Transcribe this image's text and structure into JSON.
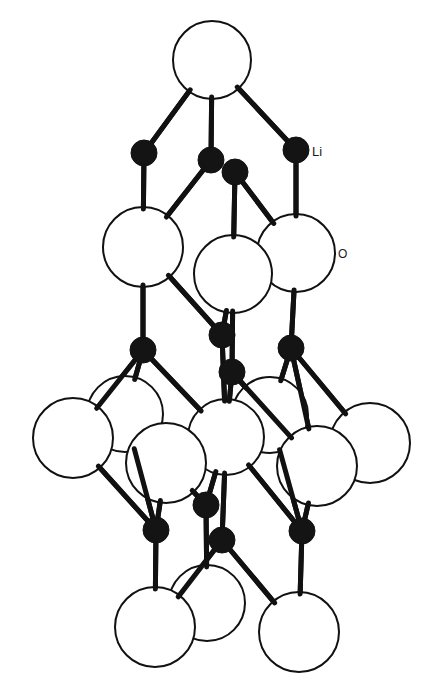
{
  "diagram": {
    "type": "crystal-structure",
    "background_color": "#ffffff",
    "stroke_color": "#111111",
    "labels": {
      "li": {
        "text": "Li",
        "x": 312,
        "y": 156
      },
      "o": {
        "text": "O",
        "x": 338,
        "y": 258
      }
    },
    "legend_colors": {
      "Li": "#141414",
      "O": "#ffffff"
    },
    "oxygen_atoms": [
      {
        "id": "o1",
        "x": 212,
        "y": 60,
        "r": 39
      },
      {
        "id": "o2",
        "x": 143,
        "y": 247,
        "r": 40
      },
      {
        "id": "o4",
        "x": 296,
        "y": 253,
        "r": 39
      },
      {
        "id": "o3",
        "x": 233,
        "y": 274,
        "r": 39
      },
      {
        "id": "o5",
        "x": 125,
        "y": 414,
        "r": 38
      },
      {
        "id": "o6",
        "x": 270,
        "y": 415,
        "r": 38
      },
      {
        "id": "o7",
        "x": 73,
        "y": 438,
        "r": 40
      },
      {
        "id": "o9",
        "x": 226,
        "y": 437,
        "r": 38
      },
      {
        "id": "o11",
        "x": 370,
        "y": 443,
        "r": 40
      },
      {
        "id": "o8",
        "x": 166,
        "y": 463,
        "r": 40
      },
      {
        "id": "o10",
        "x": 317,
        "y": 466,
        "r": 40
      },
      {
        "id": "o12",
        "x": 207,
        "y": 603,
        "r": 38
      },
      {
        "id": "o13",
        "x": 155,
        "y": 627,
        "r": 40
      },
      {
        "id": "o14",
        "x": 299,
        "y": 632,
        "r": 40
      }
    ],
    "lithium_atoms": [
      {
        "id": "li1",
        "x": 144,
        "y": 153,
        "r": 13
      },
      {
        "id": "li2",
        "x": 211,
        "y": 160,
        "r": 13
      },
      {
        "id": "li3",
        "x": 235,
        "y": 172,
        "r": 13
      },
      {
        "id": "li4",
        "x": 296,
        "y": 150,
        "r": 13
      },
      {
        "id": "li5",
        "x": 143,
        "y": 350,
        "r": 13
      },
      {
        "id": "li6",
        "x": 222,
        "y": 335,
        "r": 13
      },
      {
        "id": "li7",
        "x": 232,
        "y": 372,
        "r": 13
      },
      {
        "id": "li8",
        "x": 291,
        "y": 348,
        "r": 13
      },
      {
        "id": "li9",
        "x": 156,
        "y": 530,
        "r": 13
      },
      {
        "id": "li10",
        "x": 206,
        "y": 505,
        "r": 13
      },
      {
        "id": "li11",
        "x": 222,
        "y": 540,
        "r": 13
      },
      {
        "id": "li12",
        "x": 302,
        "y": 531,
        "r": 13
      }
    ],
    "bonds": [
      [
        "o1",
        "li1"
      ],
      [
        "o1",
        "li2"
      ],
      [
        "o1",
        "li4"
      ],
      [
        "li1",
        "o2"
      ],
      [
        "li2",
        "o2"
      ],
      [
        "li3",
        "o3"
      ],
      [
        "li3",
        "o4"
      ],
      [
        "li4",
        "o4"
      ],
      [
        "o2",
        "li5"
      ],
      [
        "o2",
        "li6"
      ],
      [
        "o3",
        "li6"
      ],
      [
        "o3",
        "li7"
      ],
      [
        "o4",
        "li8"
      ],
      [
        "li5",
        "o7"
      ],
      [
        "li5",
        "o5"
      ],
      [
        "li5",
        "o9"
      ],
      [
        "li6",
        "o9"
      ],
      [
        "li7",
        "o9"
      ],
      [
        "li7",
        "o6"
      ],
      [
        "li7",
        "o10"
      ],
      [
        "li8",
        "o10"
      ],
      [
        "li8",
        "o6"
      ],
      [
        "li8",
        "o11"
      ],
      [
        "o7",
        "li9"
      ],
      [
        "o8",
        "li9"
      ],
      [
        "o5",
        "li9"
      ],
      [
        "o9",
        "li10"
      ],
      [
        "o9",
        "li11"
      ],
      [
        "o8",
        "li10"
      ],
      [
        "o9",
        "li12"
      ],
      [
        "o10",
        "li12"
      ],
      [
        "o6",
        "li12"
      ],
      [
        "li9",
        "o13"
      ],
      [
        "li10",
        "o12"
      ],
      [
        "li11",
        "o13"
      ],
      [
        "li11",
        "o14"
      ],
      [
        "li12",
        "o14"
      ]
    ]
  }
}
